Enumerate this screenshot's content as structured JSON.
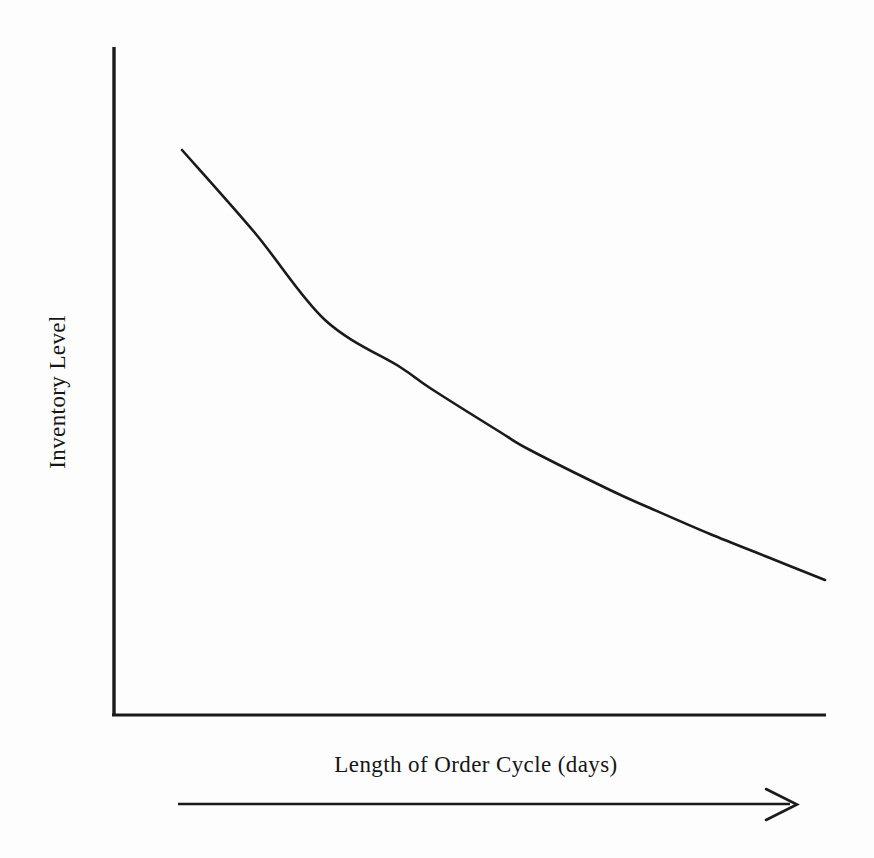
{
  "chart_data": {
    "type": "line",
    "title": "",
    "subtitle": "",
    "xlabel": "Length of Order Cycle (days)",
    "ylabel": "Inventory Level",
    "legend": [],
    "legend_position": "none",
    "grid": false,
    "x_tick_labels": [],
    "y_tick_labels": [],
    "xlim": [
      0,
      10
    ],
    "ylim": [
      0,
      10
    ],
    "annotations": [
      {
        "name": "direction-arrow",
        "text": "",
        "meaning": "arrow pointing right beneath the x-axis label indicating increasing order cycle length"
      }
    ],
    "series": [
      {
        "name": "Inventory Level",
        "color": "#1a1a1a",
        "line_width": 2.6,
        "style": "solid",
        "markers": "none",
        "description": "Smooth convex decreasing curve (exponential decay): inventory level falls as the length of the order cycle increases, with the rate of decline flattening out.",
        "x": [
          0.95,
          2.0,
          3.0,
          4.1,
          5.0,
          6.1,
          7.0,
          8.2,
          9.2,
          10.0
        ],
        "y": [
          7.95,
          6.62,
          5.63,
          4.8,
          4.25,
          3.73,
          3.38,
          2.99,
          2.7,
          2.53
        ],
        "points_px": [
          [
            182,
            150
          ],
          [
            255,
            233
          ],
          [
            325,
            320
          ],
          [
            400,
            367
          ],
          [
            430,
            388
          ],
          [
            500,
            432
          ],
          [
            530,
            450
          ],
          [
            610,
            490
          ],
          [
            650,
            508
          ],
          [
            710,
            534
          ],
          [
            770,
            558
          ],
          [
            825,
            580
          ]
        ]
      }
    ]
  },
  "axes": {
    "y_axis": {
      "name": "y-axis-line",
      "x_px": 114,
      "top_px": 47,
      "bottom_px": 715
    },
    "x_axis": {
      "name": "x-axis-line",
      "y_px": 715,
      "left_px": 114,
      "right_px": 826
    }
  },
  "colors": {
    "background": "#fdfdfd",
    "axis": "#1a1a1a",
    "curve": "#1a1a1a",
    "text": "#161616",
    "arrow": "#1a1a1a"
  }
}
